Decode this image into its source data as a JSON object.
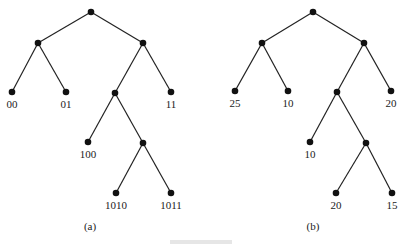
{
  "trees": [
    {
      "caption": "(a)",
      "nodes": [
        {
          "id": "r",
          "x": 91,
          "y": 12,
          "label": ""
        },
        {
          "id": "L",
          "x": 38,
          "y": 43,
          "label": ""
        },
        {
          "id": "R",
          "x": 143,
          "y": 43,
          "label": ""
        },
        {
          "id": "LL",
          "x": 12,
          "y": 92,
          "label": "00"
        },
        {
          "id": "LR",
          "x": 66,
          "y": 92,
          "label": "01"
        },
        {
          "id": "RL",
          "x": 115,
          "y": 93,
          "label": ""
        },
        {
          "id": "RR",
          "x": 171,
          "y": 92,
          "label": "11"
        },
        {
          "id": "RLL",
          "x": 88,
          "y": 142,
          "label": "100"
        },
        {
          "id": "RLR",
          "x": 143,
          "y": 143,
          "label": ""
        },
        {
          "id": "RLRL",
          "x": 116,
          "y": 193,
          "label": "1010"
        },
        {
          "id": "RLRR",
          "x": 171,
          "y": 193,
          "label": "1011"
        }
      ],
      "edges": [
        [
          "r",
          "L"
        ],
        [
          "r",
          "R"
        ],
        [
          "L",
          "LL"
        ],
        [
          "L",
          "LR"
        ],
        [
          "R",
          "RL"
        ],
        [
          "R",
          "RR"
        ],
        [
          "RL",
          "RLL"
        ],
        [
          "RL",
          "RLR"
        ],
        [
          "RLR",
          "RLRL"
        ],
        [
          "RLR",
          "RLRR"
        ]
      ],
      "caption_pos": {
        "x": 90,
        "y": 230
      }
    },
    {
      "caption": "(b)",
      "nodes": [
        {
          "id": "r",
          "x": 313,
          "y": 12,
          "label": ""
        },
        {
          "id": "L",
          "x": 262,
          "y": 43,
          "label": ""
        },
        {
          "id": "R",
          "x": 364,
          "y": 43,
          "label": ""
        },
        {
          "id": "LL",
          "x": 235,
          "y": 91,
          "label": "25"
        },
        {
          "id": "LR",
          "x": 288,
          "y": 91,
          "label": "10"
        },
        {
          "id": "RL",
          "x": 337,
          "y": 92,
          "label": ""
        },
        {
          "id": "RR",
          "x": 391,
          "y": 91,
          "label": "20"
        },
        {
          "id": "RLL",
          "x": 310,
          "y": 142,
          "label": "10"
        },
        {
          "id": "RLR",
          "x": 366,
          "y": 143,
          "label": ""
        },
        {
          "id": "RLRL",
          "x": 336,
          "y": 193,
          "label": "20"
        },
        {
          "id": "RLRR",
          "x": 392,
          "y": 193,
          "label": "15"
        }
      ],
      "edges": [
        [
          "r",
          "L"
        ],
        [
          "r",
          "R"
        ],
        [
          "L",
          "LL"
        ],
        [
          "L",
          "LR"
        ],
        [
          "R",
          "RL"
        ],
        [
          "R",
          "RR"
        ],
        [
          "RL",
          "RLL"
        ],
        [
          "RL",
          "RLR"
        ],
        [
          "RLR",
          "RLRL"
        ],
        [
          "RLR",
          "RLRR"
        ]
      ],
      "caption_pos": {
        "x": 313,
        "y": 230
      }
    }
  ]
}
